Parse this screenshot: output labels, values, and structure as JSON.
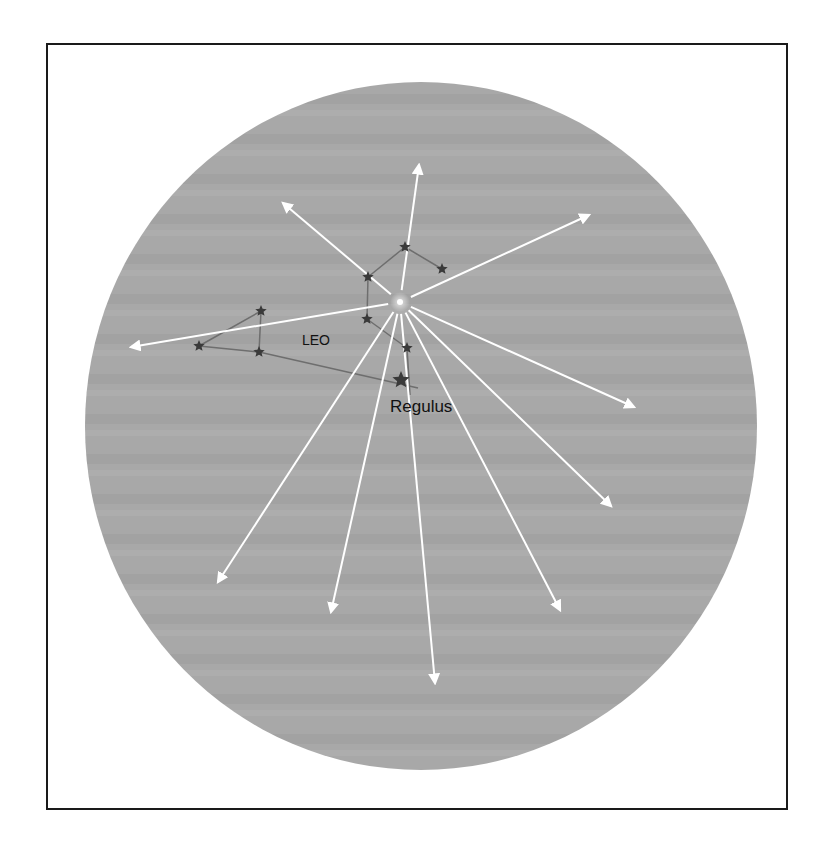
{
  "diagram": {
    "labels": {
      "constellation": "LEO",
      "star": "Regulus"
    },
    "colors": {
      "sky": "#a9a9a9",
      "meteor_trail": "#ffffff",
      "star": "#3a3a3a",
      "constellation_line": "#6e6e6e",
      "border": "#1a1a1a"
    },
    "sky_disc": {
      "cx": 421,
      "cy": 426,
      "rx": 336,
      "ry": 344
    },
    "radiant": {
      "x": 400,
      "y": 302
    },
    "meteor_tips": [
      {
        "x": 419,
        "y": 165
      },
      {
        "x": 283,
        "y": 203
      },
      {
        "x": 589,
        "y": 215
      },
      {
        "x": 131,
        "y": 347
      },
      {
        "x": 634,
        "y": 407
      },
      {
        "x": 611,
        "y": 506
      },
      {
        "x": 560,
        "y": 610
      },
      {
        "x": 435,
        "y": 683
      },
      {
        "x": 331,
        "y": 612
      },
      {
        "x": 218,
        "y": 582
      }
    ],
    "stars": [
      {
        "name": "leo-star-1",
        "x": 405,
        "y": 247,
        "size": 6
      },
      {
        "name": "leo-star-2",
        "x": 442,
        "y": 269,
        "size": 6
      },
      {
        "name": "leo-star-3",
        "x": 368,
        "y": 277,
        "size": 6
      },
      {
        "name": "leo-star-4",
        "x": 367,
        "y": 319,
        "size": 6
      },
      {
        "name": "leo-star-5",
        "x": 407,
        "y": 348,
        "size": 6
      },
      {
        "name": "regulus",
        "x": 401,
        "y": 380,
        "size": 9
      },
      {
        "name": "leo-star-6",
        "x": 261,
        "y": 311,
        "size": 6
      },
      {
        "name": "leo-star-7",
        "x": 199,
        "y": 346,
        "size": 6
      },
      {
        "name": "leo-star-8",
        "x": 259,
        "y": 352,
        "size": 6
      }
    ],
    "constellation_lines": [
      [
        442,
        269,
        405,
        247
      ],
      [
        405,
        247,
        368,
        277
      ],
      [
        368,
        277,
        367,
        319
      ],
      [
        367,
        319,
        407,
        348
      ],
      [
        407,
        348,
        410,
        395
      ],
      [
        261,
        311,
        259,
        352
      ],
      [
        261,
        311,
        199,
        346
      ],
      [
        199,
        346,
        259,
        352
      ],
      [
        259,
        352,
        418,
        388
      ]
    ]
  }
}
